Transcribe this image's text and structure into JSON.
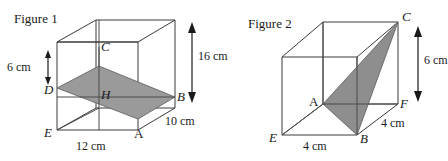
{
  "page": {
    "width": 448,
    "height": 161,
    "background": "#ffffff",
    "stroke_color": "#3a3a3a",
    "shade_color": "#9a9a9a",
    "text_color": "#1a1a1a"
  },
  "figure1": {
    "title": "Figure 1",
    "vertices": [
      {
        "name": "C",
        "label": "C",
        "italic": true
      },
      {
        "name": "D",
        "label": "D",
        "italic": true
      },
      {
        "name": "H",
        "label": "H",
        "italic": true
      },
      {
        "name": "B",
        "label": "B",
        "italic": true
      },
      {
        "name": "E",
        "label": "E",
        "italic": true
      },
      {
        "name": "A",
        "label": "A",
        "italic": false
      }
    ],
    "dimensions": [
      {
        "name": "height-left",
        "label": "6 cm",
        "value": 6,
        "unit": "cm"
      },
      {
        "name": "height-right",
        "label": "16 cm",
        "value": 16,
        "unit": "cm"
      },
      {
        "name": "depth",
        "label": "10 cm",
        "value": 10,
        "unit": "cm"
      },
      {
        "name": "width",
        "label": "12 cm",
        "value": 12,
        "unit": "cm"
      }
    ],
    "shaded_region": "parallelogram-D-C-B-A"
  },
  "figure2": {
    "title": "Figure 2",
    "vertices": [
      {
        "name": "C",
        "label": "C",
        "italic": true
      },
      {
        "name": "A",
        "label": "A",
        "italic": false
      },
      {
        "name": "F",
        "label": "F",
        "italic": true
      },
      {
        "name": "B",
        "label": "B",
        "italic": true
      },
      {
        "name": "E",
        "label": "E",
        "italic": true
      }
    ],
    "dimensions": [
      {
        "name": "height-right",
        "label": "6 cm",
        "value": 6,
        "unit": "cm"
      },
      {
        "name": "depth",
        "label": "4 cm",
        "value": 4,
        "unit": "cm"
      },
      {
        "name": "width",
        "label": "4 cm",
        "value": 4,
        "unit": "cm"
      }
    ],
    "shaded_region": "triangle-A-B-C"
  }
}
